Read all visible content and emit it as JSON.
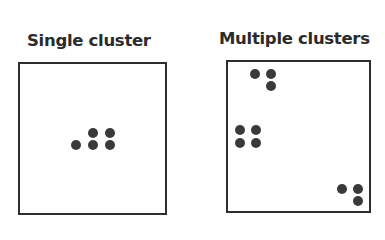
{
  "panels": [
    {
      "id": "single",
      "title": "Single cluster",
      "title_pos": {
        "x": 27,
        "y": 33
      },
      "frame": {
        "x": 18,
        "y": 62,
        "w": 149,
        "h": 153
      },
      "points": [
        {
          "x": 76,
          "y": 145,
          "cluster": 1
        },
        {
          "x": 93,
          "y": 133,
          "cluster": 1
        },
        {
          "x": 110,
          "y": 133,
          "cluster": 1
        },
        {
          "x": 93,
          "y": 145,
          "cluster": 1
        },
        {
          "x": 110,
          "y": 145,
          "cluster": 1
        }
      ]
    },
    {
      "id": "multiple",
      "title": "Multiple clusters",
      "title_pos": {
        "x": 219,
        "y": 31
      },
      "frame": {
        "x": 226,
        "y": 60,
        "w": 145,
        "h": 153
      },
      "points": [
        {
          "x": 255,
          "y": 74,
          "cluster": 1
        },
        {
          "x": 271,
          "y": 74,
          "cluster": 1
        },
        {
          "x": 271,
          "y": 86,
          "cluster": 1
        },
        {
          "x": 240,
          "y": 130,
          "cluster": 2
        },
        {
          "x": 256,
          "y": 130,
          "cluster": 2
        },
        {
          "x": 240,
          "y": 143,
          "cluster": 2
        },
        {
          "x": 256,
          "y": 143,
          "cluster": 2
        },
        {
          "x": 342,
          "y": 189,
          "cluster": 3
        },
        {
          "x": 358,
          "y": 189,
          "cluster": 3
        },
        {
          "x": 358,
          "y": 201,
          "cluster": 3
        }
      ]
    }
  ],
  "colors": {
    "dot": "#3a3a3a",
    "frame": "#2e2e2e",
    "title": "#2b2b2b",
    "background": "#ffffff"
  }
}
